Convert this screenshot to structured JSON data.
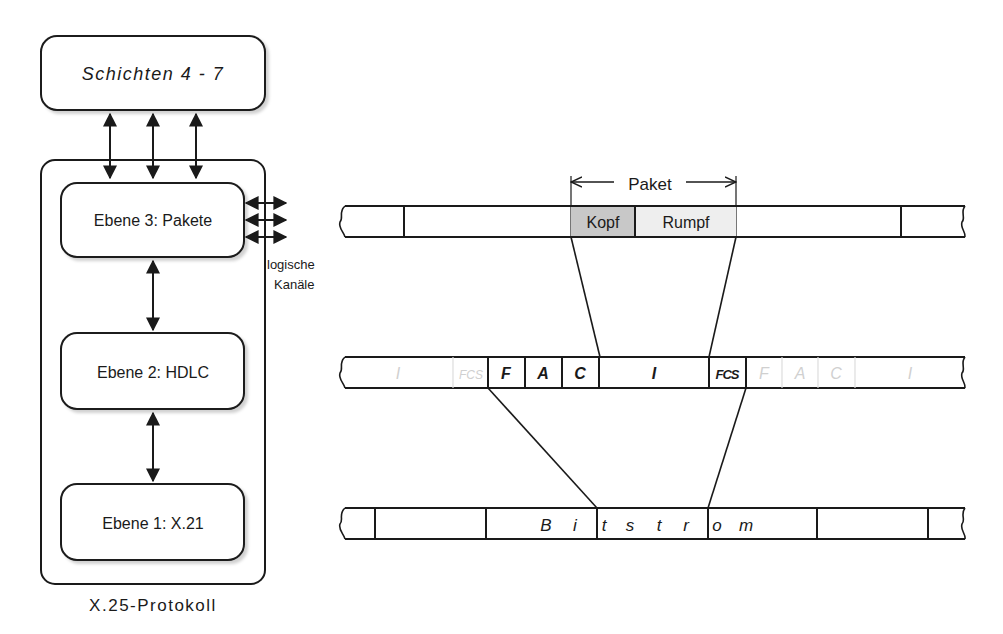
{
  "stack": {
    "top_box": "Schichten 4 - 7",
    "layer3": "Ebene 3: Pakete",
    "layer2": "Ebene 2: HDLC",
    "layer1": "Ebene 1: X.21",
    "side_label_line1": "logische",
    "side_label_line2": "Kanäle",
    "caption": "X.25-Protokoll"
  },
  "packet_row": {
    "span_label": "Paket",
    "header": "Kopf",
    "body": "Rumpf",
    "header_fill": "#c8c8c8",
    "body_fill": "#eeeeee"
  },
  "frame_row": {
    "faded_prev": [
      "I",
      "FCS"
    ],
    "fields": [
      "F",
      "A",
      "C",
      "I",
      "FCS"
    ],
    "faded_next": [
      "F",
      "A",
      "C",
      "I"
    ]
  },
  "bit_row": {
    "letters": [
      "B",
      "i",
      "t",
      "s",
      "t",
      "r",
      "o",
      "m"
    ]
  }
}
